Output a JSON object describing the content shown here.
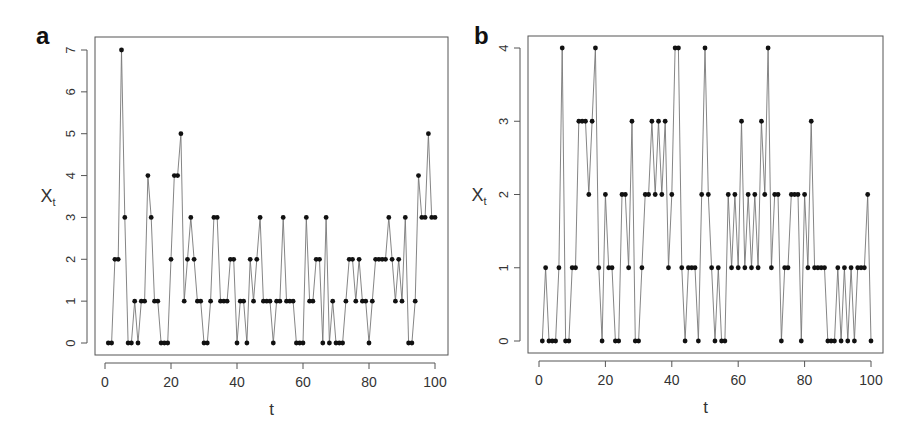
{
  "chart_data": [
    {
      "panel": "a",
      "type": "line",
      "title": "",
      "xlabel": "t",
      "ylabel": "X_t",
      "xlim": [
        0,
        100
      ],
      "ylim": [
        0,
        7
      ],
      "xticks": [
        0,
        20,
        40,
        60,
        80,
        100
      ],
      "yticks": [
        0,
        1,
        2,
        3,
        4,
        5,
        6,
        7
      ],
      "grid": false,
      "legend": null,
      "markers": "filled circles",
      "x": [
        1,
        2,
        3,
        4,
        5,
        6,
        7,
        8,
        9,
        10,
        11,
        12,
        13,
        14,
        15,
        16,
        17,
        18,
        19,
        20,
        21,
        22,
        23,
        24,
        25,
        26,
        27,
        28,
        29,
        30,
        31,
        32,
        33,
        34,
        35,
        36,
        37,
        38,
        39,
        40,
        41,
        42,
        43,
        44,
        45,
        46,
        47,
        48,
        49,
        50,
        51,
        52,
        53,
        54,
        55,
        56,
        57,
        58,
        59,
        60,
        61,
        62,
        63,
        64,
        65,
        66,
        67,
        68,
        69,
        70,
        71,
        72,
        73,
        74,
        75,
        76,
        77,
        78,
        79,
        80,
        81,
        82,
        83,
        84,
        85,
        86,
        87,
        88,
        89,
        90,
        91,
        92,
        93,
        94,
        95,
        96,
        97,
        98,
        99,
        100
      ],
      "values": [
        0,
        0,
        2,
        2,
        7,
        3,
        0,
        0,
        1,
        0,
        1,
        1,
        4,
        3,
        1,
        1,
        0,
        0,
        0,
        2,
        4,
        4,
        5,
        1,
        2,
        3,
        2,
        1,
        1,
        0,
        0,
        1,
        3,
        3,
        1,
        1,
        1,
        2,
        2,
        0,
        1,
        1,
        0,
        2,
        1,
        2,
        3,
        1,
        1,
        1,
        0,
        1,
        1,
        3,
        1,
        1,
        1,
        0,
        0,
        0,
        3,
        1,
        1,
        2,
        2,
        0,
        3,
        0,
        1,
        0,
        0,
        0,
        1,
        2,
        2,
        1,
        2,
        1,
        1,
        0,
        1,
        2,
        2,
        2,
        2,
        3,
        2,
        1,
        2,
        1,
        3,
        0,
        0,
        1,
        4,
        3,
        3,
        5,
        3,
        3
      ]
    },
    {
      "panel": "b",
      "type": "line",
      "title": "",
      "xlabel": "t",
      "ylabel": "X_t",
      "xlim": [
        0,
        100
      ],
      "ylim": [
        0,
        4
      ],
      "xticks": [
        0,
        20,
        40,
        60,
        80,
        100
      ],
      "yticks": [
        0,
        1,
        2,
        3,
        4
      ],
      "grid": false,
      "legend": null,
      "markers": "filled circles",
      "x": [
        1,
        2,
        3,
        4,
        5,
        6,
        7,
        8,
        9,
        10,
        11,
        12,
        13,
        14,
        15,
        16,
        17,
        18,
        19,
        20,
        21,
        22,
        23,
        24,
        25,
        26,
        27,
        28,
        29,
        30,
        31,
        32,
        33,
        34,
        35,
        36,
        37,
        38,
        39,
        40,
        41,
        42,
        43,
        44,
        45,
        46,
        47,
        48,
        49,
        50,
        51,
        52,
        53,
        54,
        55,
        56,
        57,
        58,
        59,
        60,
        61,
        62,
        63,
        64,
        65,
        66,
        67,
        68,
        69,
        70,
        71,
        72,
        73,
        74,
        75,
        76,
        77,
        78,
        79,
        80,
        81,
        82,
        83,
        84,
        85,
        86,
        87,
        88,
        89,
        90,
        91,
        92,
        93,
        94,
        95,
        96,
        97,
        98,
        99,
        100
      ],
      "values": [
        0,
        1,
        0,
        0,
        0,
        1,
        4,
        0,
        0,
        1,
        1,
        3,
        3,
        3,
        2,
        3,
        4,
        1,
        0,
        2,
        1,
        1,
        0,
        0,
        2,
        2,
        1,
        3,
        0,
        0,
        1,
        2,
        2,
        3,
        2,
        3,
        2,
        3,
        1,
        2,
        4,
        4,
        1,
        0,
        1,
        1,
        1,
        0,
        2,
        4,
        2,
        1,
        0,
        1,
        0,
        0,
        2,
        1,
        2,
        1,
        3,
        1,
        2,
        1,
        2,
        1,
        3,
        2,
        4,
        1,
        2,
        2,
        0,
        1,
        1,
        2,
        2,
        2,
        0,
        2,
        1,
        3,
        1,
        1,
        1,
        1,
        0,
        0,
        0,
        1,
        0,
        1,
        0,
        1,
        0,
        1,
        1,
        1,
        2,
        0
      ]
    }
  ],
  "panels": {
    "a": {
      "label": "a",
      "xlabel": "t",
      "ylabel_main": "X",
      "ylabel_sub": "t",
      "xtick_labels": [
        "0",
        "20",
        "40",
        "60",
        "80",
        "100"
      ],
      "ytick_labels": [
        "0",
        "1",
        "2",
        "3",
        "4",
        "5",
        "6",
        "7"
      ]
    },
    "b": {
      "label": "b",
      "xlabel": "t",
      "ylabel_main": "X",
      "ylabel_sub": "t",
      "xtick_labels": [
        "0",
        "20",
        "40",
        "60",
        "80",
        "100"
      ],
      "ytick_labels": [
        "0",
        "1",
        "2",
        "3",
        "4"
      ]
    }
  },
  "colors": {
    "line": "#777777",
    "marker": "#111111",
    "frame": "#555555",
    "text": "#333333"
  }
}
